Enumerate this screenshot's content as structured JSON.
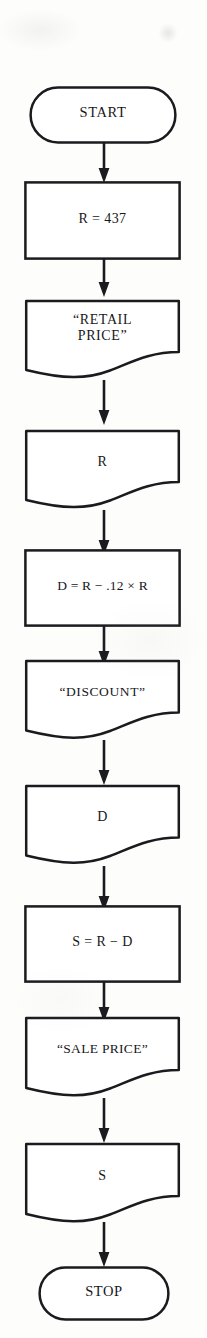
{
  "diagram": {
    "stroke_color": "#1b1b1f",
    "text_color": "#17171a",
    "background_color": "#fdfdfc",
    "nodes": [
      {
        "id": "start",
        "shape": "terminator",
        "text": "START"
      },
      {
        "id": "assign-r",
        "shape": "process",
        "text": "R = 437"
      },
      {
        "id": "print-retail",
        "shape": "document",
        "text": "“RETAIL\nPRICE”"
      },
      {
        "id": "output-r",
        "shape": "document",
        "text": "R"
      },
      {
        "id": "compute-d",
        "shape": "process",
        "text": "D = R − .12 × R"
      },
      {
        "id": "print-discount",
        "shape": "document",
        "text": "“DISCOUNT”"
      },
      {
        "id": "output-d",
        "shape": "document",
        "text": "D"
      },
      {
        "id": "compute-s",
        "shape": "process",
        "text": "S = R − D"
      },
      {
        "id": "print-sale",
        "shape": "document",
        "text": "“SALE PRICE”"
      },
      {
        "id": "output-s",
        "shape": "document",
        "text": "S"
      },
      {
        "id": "stop",
        "shape": "terminator",
        "text": "STOP"
      }
    ],
    "edges": [
      {
        "from": "start",
        "to": "assign-r"
      },
      {
        "from": "assign-r",
        "to": "print-retail"
      },
      {
        "from": "print-retail",
        "to": "output-r"
      },
      {
        "from": "output-r",
        "to": "compute-d"
      },
      {
        "from": "compute-d",
        "to": "print-discount"
      },
      {
        "from": "print-discount",
        "to": "output-d"
      },
      {
        "from": "output-d",
        "to": "compute-s"
      },
      {
        "from": "compute-s",
        "to": "print-sale"
      },
      {
        "from": "print-sale",
        "to": "output-s"
      },
      {
        "from": "output-s",
        "to": "stop"
      }
    ]
  }
}
